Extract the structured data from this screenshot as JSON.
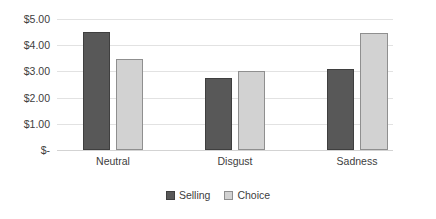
{
  "chart_data": {
    "type": "bar",
    "title": "",
    "subtitle": "",
    "xlabel": "",
    "ylabel": "",
    "categories": [
      "Neutral",
      "Disgust",
      "Sadness"
    ],
    "series": [
      {
        "name": "Selling",
        "values": [
          4.5,
          2.75,
          3.1
        ],
        "color": "#585858"
      },
      {
        "name": "Choice",
        "values": [
          3.47,
          3.0,
          4.47
        ],
        "color": "#d2d2d2"
      }
    ],
    "ylim": [
      0,
      5
    ],
    "y_ticks": [
      0,
      1,
      2,
      3,
      4,
      5
    ],
    "y_tick_labels": [
      "$-",
      "$1.00",
      "$2.00",
      "$3.00",
      "$4.00",
      "$5.00"
    ],
    "grid": true,
    "grid_axis": "y",
    "legend": [
      "Selling",
      "Choice"
    ],
    "legend_position": "bottom",
    "value_prefix": "$"
  },
  "axis": {
    "y_labels": [
      "$5.00",
      "$4.00",
      "$3.00",
      "$2.00",
      "$1.00",
      "$-"
    ],
    "x_labels": [
      "Neutral",
      "Disgust",
      "Sadness"
    ]
  },
  "legend": {
    "items": [
      {
        "label": "Selling",
        "swatch": "selling"
      },
      {
        "label": "Choice",
        "swatch": "choice"
      }
    ]
  }
}
